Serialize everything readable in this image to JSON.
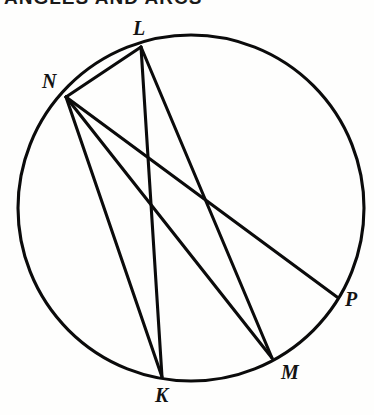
{
  "figure": {
    "background_color": "#fefefd",
    "stroke_color": "#0b0b0b",
    "stroke_width": 3.1,
    "width": 374,
    "height": 415
  },
  "header": {
    "clipped_text": "ANGLES AND ARCS",
    "note": "top line of text is cropped off at the image edge and is not legible"
  },
  "chart_data": {
    "type": "diagram",
    "subtype": "circle-geometry",
    "circle": {
      "center_x": 191,
      "center_y": 208,
      "radius": 173,
      "label": "circle"
    },
    "points": [
      {
        "id": "L",
        "label": "L",
        "x": 141,
        "y": 47,
        "label_x": 133,
        "label_y": 18,
        "position": "top"
      },
      {
        "id": "N",
        "label": "N",
        "x": 66,
        "y": 97,
        "label_x": 42,
        "label_y": 71,
        "position": "upper-left"
      },
      {
        "id": "K",
        "label": "K",
        "x": 162,
        "y": 377,
        "label_x": 155,
        "label_y": 385,
        "position": "bottom"
      },
      {
        "id": "M",
        "label": "M",
        "x": 272,
        "y": 358,
        "label_x": 281,
        "label_y": 362,
        "position": "lower-right"
      },
      {
        "id": "P",
        "label": "P",
        "x": 337,
        "y": 297,
        "label_x": 345,
        "label_y": 289,
        "position": "right"
      }
    ],
    "chords": [
      {
        "id": "LN",
        "from": "L",
        "to": "N",
        "label": "LN"
      },
      {
        "id": "LK",
        "from": "L",
        "to": "K",
        "label": "LK"
      },
      {
        "id": "LM",
        "from": "L",
        "to": "M",
        "label": "LM"
      },
      {
        "id": "NK",
        "from": "N",
        "to": "K",
        "label": "NK"
      },
      {
        "id": "NM",
        "from": "N",
        "to": "M",
        "label": "NM"
      },
      {
        "id": "NP",
        "from": "N",
        "to": "P",
        "label": "NP"
      }
    ],
    "xlabel": "",
    "ylabel": "",
    "grid": false,
    "legend": false
  }
}
